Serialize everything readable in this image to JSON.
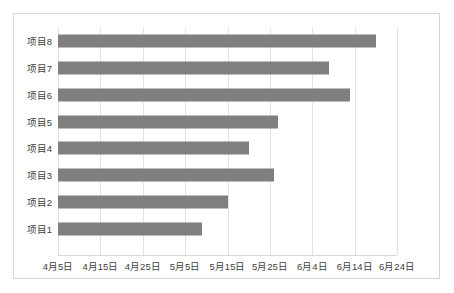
{
  "chart_data": {
    "type": "bar",
    "orientation": "horizontal",
    "title": "",
    "subtitle": "",
    "xlabel": "",
    "ylabel": "",
    "grid": true,
    "legend": false,
    "legend_position": "none",
    "bar_color": "#7f7f7f",
    "gridline_color": "#e3e3e3",
    "border_color": "#d6d6d6",
    "categories": [
      "项目1",
      "项目2",
      "项目3",
      "项目4",
      "项目5",
      "项目6",
      "项目7",
      "项目8"
    ],
    "category_order_top_to_bottom": [
      "项目8",
      "项目7",
      "项目6",
      "项目5",
      "项目4",
      "项目3",
      "项目2",
      "项目1"
    ],
    "x_tick_labels": [
      "4月5日",
      "4月15日",
      "4月25日",
      "5月5日",
      "5月15日",
      "5月25日",
      "6月4日",
      "6月14日",
      "6月24日"
    ],
    "x_tick_days": [
      0,
      10,
      20,
      30,
      40,
      50,
      60,
      70,
      80
    ],
    "xlim_days": [
      0,
      80
    ],
    "value_unit": "days from 4月5日",
    "values": [
      34,
      40,
      51,
      45,
      52,
      69,
      64,
      75
    ],
    "end_dates": [
      "5月9日",
      "5月15日",
      "5月26日",
      "5月20日",
      "5月27日",
      "6月13日",
      "6月8日",
      "6月19日"
    ],
    "bars": [
      {
        "label": "项目8",
        "value": 75,
        "end_date": "6月19日"
      },
      {
        "label": "项目7",
        "value": 64,
        "end_date": "6月8日"
      },
      {
        "label": "项目6",
        "value": 69,
        "end_date": "6月13日"
      },
      {
        "label": "项目5",
        "value": 52,
        "end_date": "5月27日"
      },
      {
        "label": "项目4",
        "value": 45,
        "end_date": "5月20日"
      },
      {
        "label": "项目3",
        "value": 51,
        "end_date": "5月26日"
      },
      {
        "label": "项目2",
        "value": 40,
        "end_date": "5月15日"
      },
      {
        "label": "项目1",
        "value": 34,
        "end_date": "5月9日"
      }
    ]
  }
}
